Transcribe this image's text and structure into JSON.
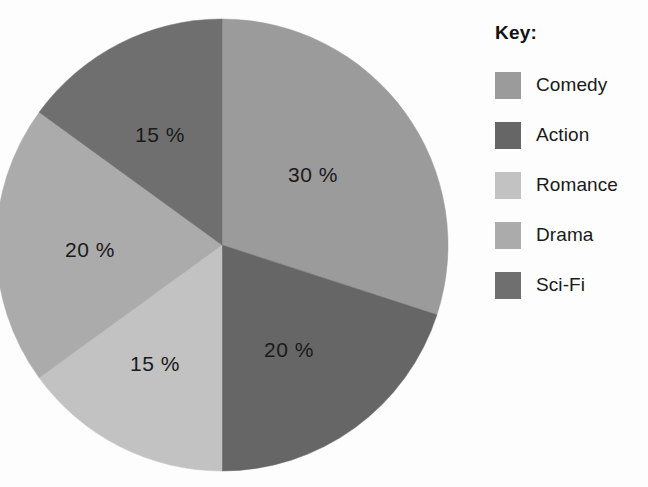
{
  "legend": {
    "title": "Key:",
    "items": [
      {
        "label": "Comedy",
        "color": "#9b9b9b"
      },
      {
        "label": "Action",
        "color": "#666666"
      },
      {
        "label": "Romance",
        "color": "#c2c2c2"
      },
      {
        "label": "Drama",
        "color": "#ababab"
      },
      {
        "label": "Sci-Fi",
        "color": "#6f6f6f"
      }
    ]
  },
  "chart_data": {
    "type": "pie",
    "title": "",
    "legend_position": "right",
    "legend_title": "Key:",
    "categories": [
      "Comedy",
      "Action",
      "Romance",
      "Drama",
      "Sci-Fi"
    ],
    "values": [
      30,
      20,
      15,
      20,
      15
    ],
    "unit": "%",
    "labels": [
      "30 %",
      "20 %",
      "15 %",
      "20 %",
      "15 %"
    ],
    "colors": [
      "#9b9b9b",
      "#666666",
      "#c2c2c2",
      "#ababab",
      "#6f6f6f"
    ],
    "slices": [
      {
        "name": "Comedy",
        "value": 30,
        "label": "30 %",
        "color": "#9b9b9b",
        "start_angle": 0,
        "end_angle": 108,
        "label_x": 313,
        "label_y": 176
      },
      {
        "name": "Action",
        "value": 20,
        "label": "20 %",
        "color": "#666666",
        "start_angle": 108,
        "end_angle": 180,
        "label_x": 289,
        "label_y": 351
      },
      {
        "name": "Romance",
        "value": 15,
        "label": "15 %",
        "color": "#c2c2c2",
        "start_angle": 180,
        "end_angle": 234,
        "label_x": 155,
        "label_y": 365
      },
      {
        "name": "Drama",
        "value": 20,
        "label": "20 %",
        "color": "#ababab",
        "start_angle": 234,
        "end_angle": 306,
        "label_x": 90,
        "label_y": 251
      },
      {
        "name": "Sci-Fi",
        "value": 15,
        "label": "15 %",
        "color": "#6f6f6f",
        "start_angle": 306,
        "end_angle": 360,
        "label_x": 160,
        "label_y": 136
      }
    ],
    "geometry": {
      "cx": 222,
      "cy": 245,
      "r": 226
    }
  }
}
